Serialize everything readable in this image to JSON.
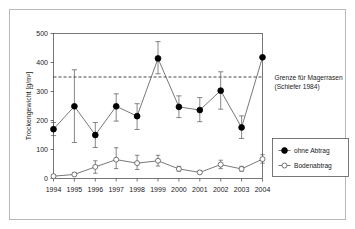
{
  "chart_data": {
    "type": "line",
    "title": "",
    "xlabel": "",
    "ylabel": "Trockengewicht [g/m²]",
    "categories": [
      "1994",
      "1995",
      "1996",
      "1997",
      "1998",
      "1999",
      "2000",
      "2001",
      "2002",
      "2003",
      "2004"
    ],
    "ylim": [
      0,
      500
    ],
    "ytick_values": [
      0,
      100,
      200,
      300,
      400,
      500
    ],
    "ytick_labels": [
      "0",
      "100",
      "200",
      "300",
      "400",
      "500"
    ],
    "grid": false,
    "legend_position": "right",
    "series": [
      {
        "name": "ohne Abtrag",
        "marker": "filled-circle",
        "values": [
          170,
          249,
          150,
          249,
          215,
          414,
          247,
          236,
          303,
          176,
          418
        ],
        "err_low": [
          148,
          124,
          107,
          198,
          169,
          361,
          210,
          196,
          239,
          138,
          418
        ],
        "err_high": [
          193,
          375,
          193,
          292,
          258,
          472,
          285,
          279,
          368,
          216,
          418
        ]
      },
      {
        "name": "Bodenabtrag",
        "marker": "open-circle",
        "values": [
          8,
          14,
          40,
          65,
          53,
          61,
          33,
          21,
          48,
          33,
          67
        ],
        "err_low": [
          4,
          9,
          18,
          34,
          31,
          43,
          25,
          16,
          34,
          25,
          53
        ],
        "err_high": [
          13,
          20,
          61,
          106,
          80,
          80,
          42,
          27,
          63,
          42,
          82
        ]
      }
    ],
    "reference_lines": [
      {
        "value": 350,
        "style": "dashed",
        "label_line1": "Grenze für Magerrasen",
        "label_line2": "(Schiefer 1984)"
      }
    ]
  },
  "legend": {
    "items": [
      {
        "label": "ohne Abtrag",
        "marker": "filled-circle"
      },
      {
        "label": "Bodenabtrag",
        "marker": "open-circle"
      }
    ]
  },
  "annotation": {
    "line1": "Grenze für Magerrasen",
    "line2": "(Schiefer 1984)"
  },
  "colors": {
    "line": "#555555",
    "marker_fill": "#000000",
    "marker_open_fill": "#ffffff",
    "axis": "#555555",
    "text": "#1a1a1a",
    "border": "#b8b8b8",
    "background": "#ffffff"
  }
}
